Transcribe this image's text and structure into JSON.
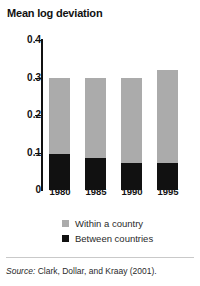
{
  "chart_data": {
    "type": "bar",
    "title": "Mean log deviation",
    "xlabel": "",
    "ylabel": "",
    "ylim": [
      0,
      0.4
    ],
    "yticks": [
      "0",
      "0.1",
      "0.2",
      "0.3",
      "0.4"
    ],
    "ytick_values": [
      0,
      0.1,
      0.2,
      0.3,
      0.4
    ],
    "grid": false,
    "stacked": true,
    "legend_position": "bottom",
    "categories": [
      "1980",
      "1985",
      "1990",
      "1995"
    ],
    "series": [
      {
        "name": "Between countries",
        "color": "#111111",
        "values": [
          0.095,
          0.086,
          0.072,
          0.072
        ]
      },
      {
        "name": "Within a country",
        "color": "#ababab",
        "values": [
          0.205,
          0.214,
          0.228,
          0.248
        ]
      }
    ],
    "totals": [
      0.3,
      0.3,
      0.3,
      0.32
    ]
  },
  "title": "Mean log deviation",
  "axis": {
    "y_ticks": [
      {
        "label": "0.4",
        "value": 0.4
      },
      {
        "label": "0.3",
        "value": 0.3
      },
      {
        "label": "0.2",
        "value": 0.2
      },
      {
        "label": "0.1",
        "value": 0.1
      },
      {
        "label": "0",
        "value": 0
      }
    ],
    "x_labels": [
      "1980",
      "1985",
      "1990",
      "1995"
    ]
  },
  "legend": {
    "items": [
      {
        "label": "Within a country",
        "color": "#ababab"
      },
      {
        "label": "Between countries",
        "color": "#111111"
      }
    ]
  },
  "source": {
    "prefix": "Source:",
    "text": " Clark, Dollar, and Kraay (2001)."
  }
}
